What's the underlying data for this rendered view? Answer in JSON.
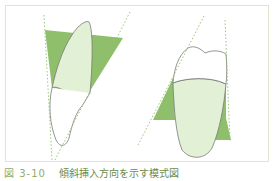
{
  "figure": {
    "caption_number": "図 3-10",
    "caption_text": "傾斜挿入方向を示す模式図",
    "colors": {
      "undercut_fill": "#8fbf6b",
      "tooth_fill": "#e2f0d6",
      "outline": "#7a7a7a",
      "guide_line": "#8fbf6b",
      "frame_border": "#dfe5cf"
    },
    "panels": [
      {
        "name": "left-tooth-tilted"
      },
      {
        "name": "right-tooth-tilted"
      }
    ]
  }
}
